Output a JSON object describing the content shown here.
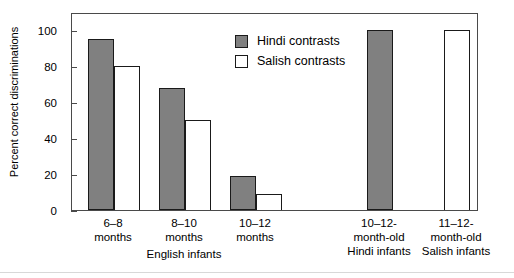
{
  "chart_data": {
    "type": "bar",
    "title": "",
    "xlabel": "English infants",
    "ylabel": "Percent correct discriminations",
    "ylim": [
      0,
      110
    ],
    "yticks": [
      0,
      20,
      40,
      60,
      80,
      100
    ],
    "ytick_labels": [
      "0",
      "20",
      "40",
      "60",
      "80",
      "100"
    ],
    "grid": false,
    "legend_position": "top-center",
    "categories": [
      "6–8 months",
      "8–10 months",
      "10–12 months",
      "10–12-month-old Hindi infants",
      "11–12-month-old Salish infants"
    ],
    "series": [
      {
        "name": "Hindi contrasts",
        "color": "#808080",
        "values": [
          95,
          68,
          19,
          100,
          null
        ]
      },
      {
        "name": "Salish contrasts",
        "color": "#ffffff",
        "values": [
          80,
          50,
          9,
          null,
          100
        ]
      }
    ]
  },
  "axis": {
    "y_title": "Percent correct discriminations",
    "y_ticks": [
      {
        "label": "100",
        "value": 100
      },
      {
        "label": "80",
        "value": 80
      },
      {
        "label": "60",
        "value": 60
      },
      {
        "label": "40",
        "value": 40
      },
      {
        "label": "20",
        "value": 20
      },
      {
        "label": "0",
        "value": 0
      }
    ],
    "x_group_label": "English infants"
  },
  "legend": {
    "entries": [
      {
        "label": "Hindi contrasts",
        "swatch": "gray-filled-square"
      },
      {
        "label": "Salish contrasts",
        "swatch": "white-outlined-square"
      }
    ]
  },
  "x_categories": [
    {
      "line1": "6–8",
      "line2": "months",
      "line3": ""
    },
    {
      "line1": "8–10",
      "line2": "months",
      "line3": ""
    },
    {
      "line1": "10–12",
      "line2": "months",
      "line3": ""
    },
    {
      "line1": "10–12-",
      "line2": "month-old",
      "line3": "Hindi infants"
    },
    {
      "line1": "11–12-",
      "line2": "month-old",
      "line3": "Salish infants"
    }
  ],
  "bars": [
    {
      "name": "bar-6-8-months-hindi",
      "series": "Hindi contrasts",
      "value": 95
    },
    {
      "name": "bar-6-8-months-salish",
      "series": "Salish contrasts",
      "value": 80
    },
    {
      "name": "bar-8-10-months-hindi",
      "series": "Hindi contrasts",
      "value": 68
    },
    {
      "name": "bar-8-10-months-salish",
      "series": "Salish contrasts",
      "value": 50
    },
    {
      "name": "bar-10-12-months-hindi",
      "series": "Hindi contrasts",
      "value": 19
    },
    {
      "name": "bar-10-12-months-salish",
      "series": "Salish contrasts",
      "value": 9
    },
    {
      "name": "bar-hindi-infants",
      "series": "Hindi contrasts",
      "value": 100
    },
    {
      "name": "bar-salish-infants",
      "series": "Salish contrasts",
      "value": 100
    }
  ]
}
